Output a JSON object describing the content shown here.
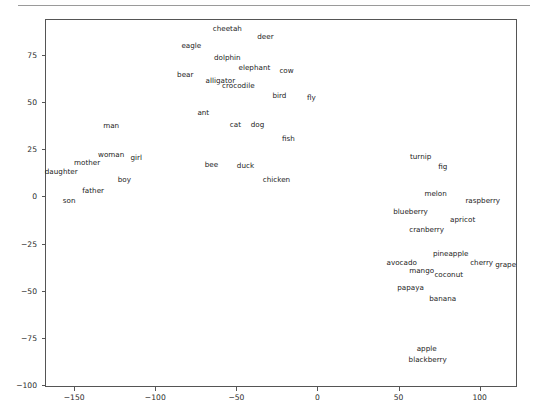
{
  "figure": {
    "background_color": "#ffffff",
    "axes_edge_color": "#555555",
    "label_color": "#1a1a1a",
    "top_rule_color": "#9a9a9a"
  },
  "chart_data": {
    "type": "scatter",
    "title": "",
    "xlabel": "",
    "ylabel": "",
    "xlim": [
      -168,
      123
    ],
    "ylim": [
      -101,
      94
    ],
    "grid": false,
    "legend": null,
    "marker_style": "text-only",
    "xticks": [
      -150,
      -100,
      -50,
      0,
      50,
      100
    ],
    "xticklabels": [
      "−150",
      "−100",
      "−50",
      "0",
      "50",
      "100"
    ],
    "yticks": [
      75,
      50,
      25,
      0,
      -25,
      -50,
      -75,
      -100
    ],
    "yticklabels": [
      "75",
      "50",
      "25",
      "0",
      "−25",
      "−50",
      "−75",
      "−100"
    ],
    "points": [
      {
        "label": "cheetah",
        "x": -55.6,
        "y": 88.5
      },
      {
        "label": "deer",
        "x": -32.1,
        "y": 84.4
      },
      {
        "label": "eagle",
        "x": -77.8,
        "y": 79.8
      },
      {
        "label": "dolphin",
        "x": -55.6,
        "y": 73.1
      },
      {
        "label": "elephant",
        "x": -38.9,
        "y": 67.9
      },
      {
        "label": "cow",
        "x": -19.1,
        "y": 66.4
      },
      {
        "label": "bear",
        "x": -81.5,
        "y": 64.4
      },
      {
        "label": "alligator",
        "x": -59.9,
        "y": 61.3
      },
      {
        "label": "crocodile",
        "x": -48.8,
        "y": 58.7
      },
      {
        "label": "bird",
        "x": -23.5,
        "y": 53.0
      },
      {
        "label": "fly",
        "x": -3.7,
        "y": 52.0
      },
      {
        "label": "ant",
        "x": -70.4,
        "y": 44.3
      },
      {
        "label": "cat",
        "x": -50.6,
        "y": 37.6
      },
      {
        "label": "dog",
        "x": -37.0,
        "y": 37.6
      },
      {
        "label": "fish",
        "x": -17.9,
        "y": 30.4
      },
      {
        "label": "man",
        "x": -127.2,
        "y": 37.1
      },
      {
        "label": "woman",
        "x": -127.2,
        "y": 22.1
      },
      {
        "label": "girl",
        "x": -111.7,
        "y": 20.6
      },
      {
        "label": "mother",
        "x": -142.0,
        "y": 17.5
      },
      {
        "label": "daughter",
        "x": -158.0,
        "y": 12.9
      },
      {
        "label": "bee",
        "x": -65.4,
        "y": 16.5
      },
      {
        "label": "duck",
        "x": -44.4,
        "y": 16.0
      },
      {
        "label": "chicken",
        "x": -25.3,
        "y": 8.7
      },
      {
        "label": "boy",
        "x": -119.1,
        "y": 8.7
      },
      {
        "label": "father",
        "x": -138.3,
        "y": 2.6
      },
      {
        "label": "son",
        "x": -153.1,
        "y": -2.6
      },
      {
        "label": "turnip",
        "x": 63.6,
        "y": 21.1
      },
      {
        "label": "fig",
        "x": 77.2,
        "y": 15.5
      },
      {
        "label": "melon",
        "x": 72.8,
        "y": 1.5
      },
      {
        "label": "raspberry",
        "x": 101.9,
        "y": -2.6
      },
      {
        "label": "blueberry",
        "x": 57.4,
        "y": -8.2
      },
      {
        "label": "apricot",
        "x": 89.5,
        "y": -12.3
      },
      {
        "label": "cranberry",
        "x": 67.3,
        "y": -18.0
      },
      {
        "label": "pineapple",
        "x": 82.1,
        "y": -30.3
      },
      {
        "label": "avocado",
        "x": 51.9,
        "y": -35.5
      },
      {
        "label": "cherry",
        "x": 101.2,
        "y": -35.5
      },
      {
        "label": "grape",
        "x": 116.0,
        "y": -36.5
      },
      {
        "label": "mango",
        "x": 64.2,
        "y": -39.6
      },
      {
        "label": "coconut",
        "x": 80.9,
        "y": -41.7
      },
      {
        "label": "papaya",
        "x": 57.4,
        "y": -48.4
      },
      {
        "label": "banana",
        "x": 77.2,
        "y": -54.6
      },
      {
        "label": "apple",
        "x": 67.3,
        "y": -81.0
      },
      {
        "label": "blackberry",
        "x": 67.9,
        "y": -86.6
      }
    ]
  }
}
